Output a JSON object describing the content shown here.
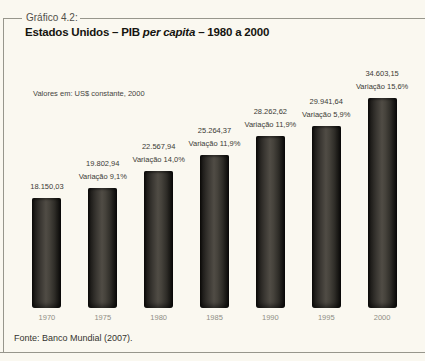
{
  "frame": {
    "tag_label": "Gráfico 4.2:"
  },
  "header": {
    "title_prefix": "Estados Unidos – PIB ",
    "title_italic": "per capita",
    "title_suffix": " – 1980 a 2000"
  },
  "chart_data": {
    "type": "bar",
    "title": "Estados Unidos – PIB per capita – 1980 a 2000",
    "note": "Valores em: US$ constante, 2000",
    "categories": [
      "1970",
      "1975",
      "1980",
      "1985",
      "1990",
      "1995",
      "2000"
    ],
    "values": [
      18150.03,
      19802.94,
      22567.94,
      25264.37,
      28262.62,
      29941.64,
      34603.15
    ],
    "value_labels": [
      "18.150,03",
      "19.802,94",
      "22.567,94",
      "25.264,37",
      "28.262,62",
      "29.941,64",
      "34.603,15"
    ],
    "variation_labels": [
      "",
      "Variação 9,1%",
      "Variação 14,0%",
      "Variação 11,9%",
      "Variação 11,9%",
      "Variação 5,9%",
      "Variação 15,6%"
    ],
    "xlabel": "",
    "ylabel": "",
    "ylim": [
      0,
      35500
    ],
    "grid": false,
    "legend": "none",
    "bar_color_edge": "#0f0e0c",
    "bar_color_mid": "#504c45",
    "source": "Fonte: Banco Mundial (2007)."
  }
}
